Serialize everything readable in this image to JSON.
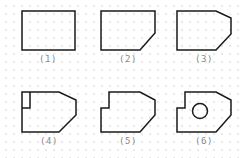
{
  "figure": {
    "title": "",
    "stroke_color": "#1a1a1a",
    "label_color": "#8a8a8a",
    "panels": [
      {
        "id": 1,
        "label": "(1)",
        "description": "plain rectangle"
      },
      {
        "id": 2,
        "label": "(2)",
        "description": "rectangle with bottom-right chamfer"
      },
      {
        "id": 3,
        "label": "(3)",
        "description": "rectangle with top-right and bottom-right chamfers"
      },
      {
        "id": 4,
        "label": "(4)",
        "description": "double-chamfered rectangle with small inner rectangle at top-left"
      },
      {
        "id": 5,
        "label": "(5)",
        "description": "double-chamfered shape with top-left notch cut out"
      },
      {
        "id": 6,
        "label": "(6)",
        "description": "notched double-chamfered shape with circular hole"
      }
    ]
  }
}
